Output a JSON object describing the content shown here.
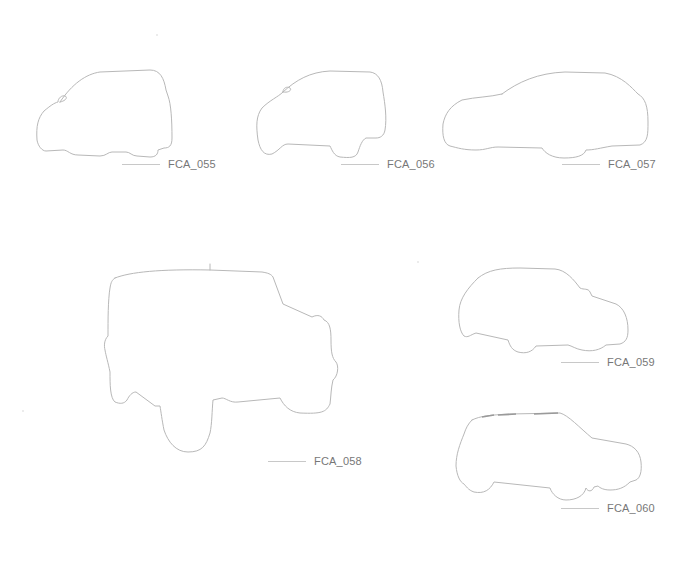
{
  "sheet": {
    "background": "#ffffff",
    "outline_color": "#b8b8b8",
    "caption_color": "#777777",
    "vehicles": [
      {
        "id": "FCA_055",
        "label": "FCA_055",
        "type": "compact hatchback side silhouette"
      },
      {
        "id": "FCA_056",
        "label": "FCA_056",
        "type": "small crossover side silhouette"
      },
      {
        "id": "FCA_057",
        "label": "FCA_057",
        "type": "sedan side silhouette"
      },
      {
        "id": "FCA_058",
        "label": "FCA_058",
        "type": "off-road SUV three-quarter silhouette"
      },
      {
        "id": "FCA_059",
        "label": "FCA_059",
        "type": "compact SUV side silhouette"
      },
      {
        "id": "FCA_060",
        "label": "FCA_060",
        "type": "boxy SUV with roof rails side silhouette"
      }
    ]
  }
}
